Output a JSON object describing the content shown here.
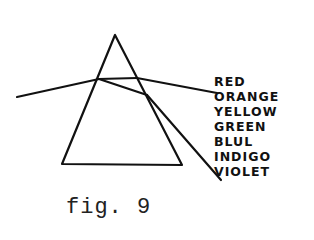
{
  "figure": {
    "caption": "fig. 9",
    "colors": {
      "ink": "#111111",
      "background": "#ffffff"
    }
  },
  "prism": {
    "apex": [
      115,
      35
    ],
    "base_left": [
      62,
      164
    ],
    "base_right": [
      182,
      165
    ]
  },
  "rays": {
    "incident": {
      "from": [
        17,
        97
      ],
      "to": [
        99,
        79
      ]
    },
    "internal_top": {
      "from": [
        99,
        79
      ],
      "to": [
        137,
        78
      ]
    },
    "internal_bottom": {
      "from": [
        99,
        79
      ],
      "to": [
        147,
        95
      ]
    },
    "exit_red": {
      "from": [
        137,
        78
      ],
      "to": [
        217,
        93
      ]
    },
    "exit_violet": {
      "from": [
        147,
        95
      ],
      "to": [
        221,
        180
      ]
    }
  },
  "spectrum_labels": [
    {
      "label": "RED"
    },
    {
      "label": "ORANGE"
    },
    {
      "label": "YELLOW"
    },
    {
      "label": "GREEN"
    },
    {
      "label": "BLUL"
    },
    {
      "label": "INDIGO"
    },
    {
      "label": "VIOLET"
    }
  ]
}
